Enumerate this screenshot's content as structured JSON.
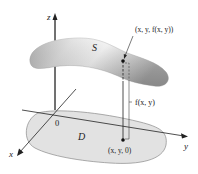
{
  "diagram": {
    "type": "3d-surface-over-region",
    "labels": {
      "z_axis": "z",
      "y_axis": "y",
      "x_axis": "x",
      "origin": "0",
      "surface": "S",
      "region": "D",
      "surface_point": "(x, y, f(x, y))",
      "height": "f(x, y)",
      "base_point": "(x, y, 0)"
    },
    "colors": {
      "surface_light": "#f4f4f4",
      "surface_dark": "#9a9a9a",
      "region_fill": "#e2e2e2",
      "region_stroke": "#8a8a8a",
      "axis": "#222222"
    }
  }
}
